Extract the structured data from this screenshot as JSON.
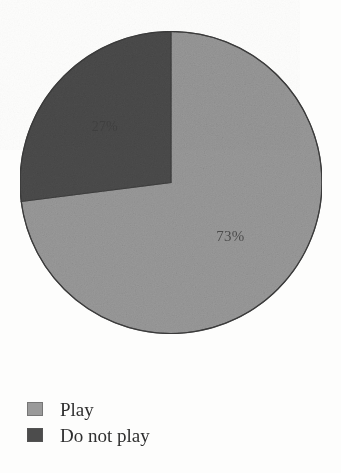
{
  "chart_data": {
    "type": "pie",
    "title": "",
    "subtitle": "",
    "xlabel": "",
    "ylabel": "",
    "grid": false,
    "legend_position": "bottom-left",
    "start_angle_deg": 0,
    "direction": "clockwise",
    "categories": [
      "Play",
      "Do not play"
    ],
    "values": [
      73,
      27
    ],
    "unit": "%",
    "slices": [
      {
        "name": "Play",
        "value": 73,
        "label": "73%",
        "color": "#9a9a9a",
        "start_deg": 0,
        "end_deg": 262.8
      },
      {
        "name": "Do not play",
        "value": 27,
        "label": "27%",
        "color": "#4c4c4c",
        "start_deg": 262.8,
        "end_deg": 360
      }
    ],
    "legend": [
      {
        "label": "Play",
        "color": "#9a9a9a"
      },
      {
        "label": "Do not play",
        "color": "#4c4c4c"
      }
    ]
  },
  "colors": {
    "play": "#9a9a9a",
    "do_not_play": "#4c4c4c",
    "outline": "#3a3a3a",
    "text": "#2f2f2f",
    "background": "#fdfdfc"
  },
  "labels": {
    "play_pct": "73%",
    "do_not_play_pct": "27%"
  },
  "legend": {
    "items": [
      {
        "label": "Play"
      },
      {
        "label": "Do not play"
      }
    ]
  },
  "caption": {
    "sliver_text": ""
  }
}
